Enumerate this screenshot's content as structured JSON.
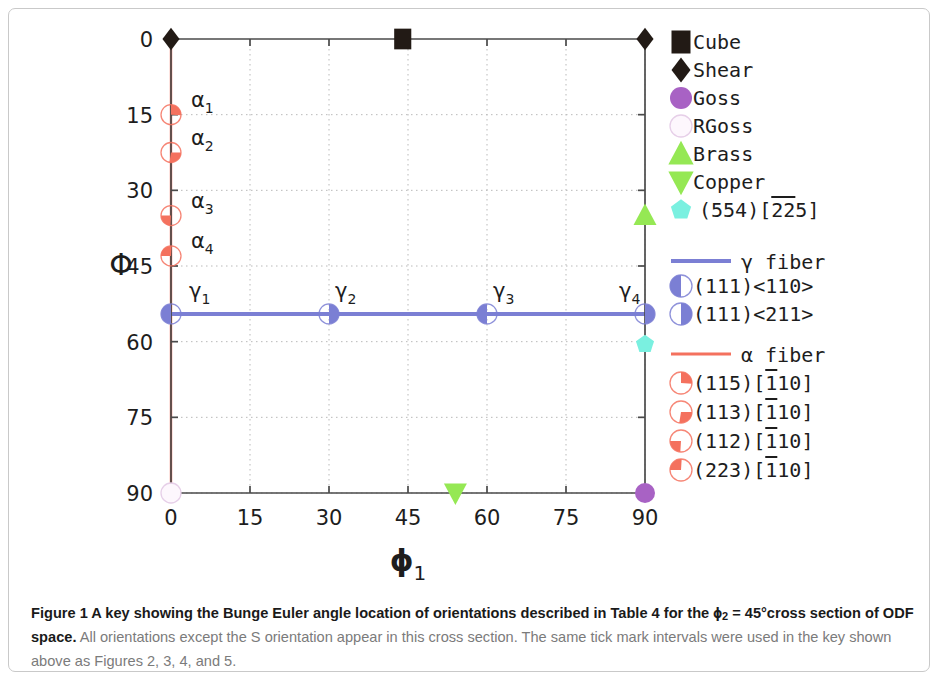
{
  "chart_data": {
    "type": "scatter",
    "title": "",
    "xlabel": "φ₁",
    "ylabel": "Φ",
    "xlim": [
      0,
      90
    ],
    "ylim": [
      0,
      90
    ],
    "y_inverted": true,
    "grid": true,
    "xticks": [
      0,
      15,
      30,
      45,
      60,
      75,
      90
    ],
    "xticklabels": [
      "0",
      "15",
      "30",
      "45",
      "60",
      "75",
      "90"
    ],
    "yticks": [
      0,
      15,
      30,
      45,
      60,
      75,
      90
    ],
    "yticklabels": [
      "0",
      "15",
      "30",
      "45",
      "60",
      "75",
      "90"
    ],
    "fibers": [
      {
        "name": "alpha",
        "label": "α fiber",
        "color": "#f4715e",
        "orientation": "vertical",
        "x": 0,
        "y_start": 0,
        "y_end": 90
      },
      {
        "name": "gamma",
        "label": "γ fiber",
        "color": "#7b7fd4",
        "orientation": "horizontal",
        "y": 54.5,
        "x_start": 0,
        "x_end": 90
      }
    ],
    "points": [
      {
        "label": "Shear",
        "x": 0,
        "y": 0,
        "marker": "diamond",
        "color": "#221a15"
      },
      {
        "label": "Cube",
        "x": 44,
        "y": 0,
        "marker": "square",
        "color": "#221a15"
      },
      {
        "label": "Shear",
        "x": 90,
        "y": 0,
        "marker": "diamond",
        "color": "#221a15"
      },
      {
        "label": "α₁",
        "x": 0,
        "y": 15,
        "marker": "pie-ne",
        "color": "#f4715e"
      },
      {
        "label": "α₂",
        "x": 0,
        "y": 22.5,
        "marker": "pie-se",
        "color": "#f4715e"
      },
      {
        "label": "α₃",
        "x": 0,
        "y": 35,
        "marker": "pie-sw",
        "color": "#f4715e"
      },
      {
        "label": "α₄",
        "x": 0,
        "y": 43,
        "marker": "pie-n",
        "color": "#f4715e"
      },
      {
        "label": "γ₁",
        "x": 0,
        "y": 54.5,
        "marker": "half-left",
        "color": "#7b7fd4"
      },
      {
        "label": "γ₂",
        "x": 30,
        "y": 54.5,
        "marker": "half-right",
        "color": "#7b7fd4"
      },
      {
        "label": "γ₃",
        "x": 60,
        "y": 54.5,
        "marker": "half-left",
        "color": "#7b7fd4"
      },
      {
        "label": "γ₄",
        "x": 90,
        "y": 54.5,
        "marker": "half-right",
        "color": "#7b7fd4"
      },
      {
        "label": "Brass",
        "x": 90,
        "y": 35,
        "marker": "triangle-up",
        "color": "#95e854"
      },
      {
        "label": "(554)[225]",
        "x": 90,
        "y": 60.5,
        "marker": "pentagon",
        "color": "#7af0e0"
      },
      {
        "label": "RGoss",
        "x": 0,
        "y": 90,
        "marker": "circle-open",
        "color": "#f0e0f0"
      },
      {
        "label": "Copper",
        "x": 54,
        "y": 90,
        "marker": "triangle-down",
        "color": "#95e854"
      },
      {
        "label": "Goss",
        "x": 90,
        "y": 90,
        "marker": "circle",
        "color": "#a862c4"
      }
    ]
  },
  "legend": {
    "orientations": [
      {
        "name": "Cube",
        "marker": "square",
        "color": "#221a15"
      },
      {
        "name": "Shear",
        "marker": "diamond",
        "color": "#221a15"
      },
      {
        "name": "Goss",
        "marker": "circle",
        "color": "#a862c4"
      },
      {
        "name": "RGoss",
        "marker": "circle-open",
        "color": "#f3e8f5"
      },
      {
        "name": "Brass",
        "marker": "triangle-up",
        "color": "#95e854"
      },
      {
        "name": "Copper",
        "marker": "triangle-down",
        "color": "#95e854"
      },
      {
        "name": "(554)[225]",
        "marker": "pentagon",
        "color": "#7af0e0",
        "overline_from": 1,
        "overline_len": 2
      }
    ],
    "gamma": {
      "title": "γ fiber",
      "color": "#7b7fd4",
      "entries": [
        {
          "name": "(111)<110>",
          "marker": "half-left"
        },
        {
          "name": "(111)<211>",
          "marker": "half-right"
        }
      ]
    },
    "alpha": {
      "title": "α fiber",
      "color": "#f4715e",
      "entries": [
        {
          "name": "(115)[110]",
          "marker": "pie-ne",
          "overline_index": 6
        },
        {
          "name": "(113)[110]",
          "marker": "pie-se",
          "overline_index": 6
        },
        {
          "name": "(112)[110]",
          "marker": "pie-sw",
          "overline_index": 6
        },
        {
          "name": "(223)[110]",
          "marker": "pie-n",
          "overline_index": 6
        }
      ]
    }
  },
  "caption": {
    "bold_lead": "Figure 1 A key showing the Bunge Euler angle location of orientations described in Table 4 for the ",
    "bold_phi": "ϕ",
    "bold_sub": "2",
    "bold_tail": " = 45°cross section of ODF space.",
    "body": " All orientations except the S orientation appear in this cross section. The same tick mark intervals were used in the key shown above as Figures 2, 3, 4, and 5."
  }
}
